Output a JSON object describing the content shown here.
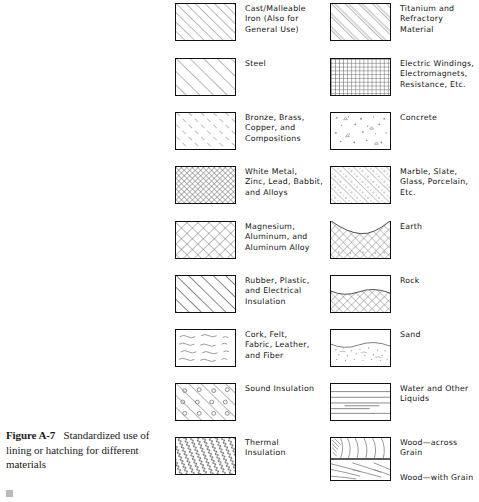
{
  "figure": {
    "caption_number": "Figure A-7",
    "caption_text": "Standardized use of lining or hatching for different materials"
  },
  "left_column": [
    {
      "pattern": "diagonal-hatch-medium",
      "label": "Cast/Malleable\nIron (Also for\nGeneral Use)"
    },
    {
      "pattern": "diagonal-hatch-wide",
      "label": "Steel"
    },
    {
      "pattern": "diagonal-hatch-dashed",
      "label": "Bronze, Brass,\nCopper, and\nCompositions"
    },
    {
      "pattern": "cross-hatch-fine",
      "label": "White Metal,\nZinc, Lead, Babbit,\nand Alloys"
    },
    {
      "pattern": "cross-hatch-coarse",
      "label": "Magnesium,\nAluminum, and\nAluminum Alloy"
    },
    {
      "pattern": "diagonal-hatch-thick",
      "label": "Rubber, Plastic,\nand Electrical\nInsulation"
    },
    {
      "pattern": "squiggle-dashes",
      "label": "Cork, Felt,\nFabric, Leather,\nand Fiber"
    },
    {
      "pattern": "diagonal-with-circles",
      "label": "Sound Insulation"
    },
    {
      "pattern": "zigzag-diagonal",
      "label": "Thermal\nInsulation"
    }
  ],
  "right_column": [
    {
      "pattern": "diagonal-hatch-double",
      "label": "Titanium and\nRefractory\nMaterial"
    },
    {
      "pattern": "square-grid",
      "label": "Electric Windings,\nElectromagnets,\nResistance, Etc."
    },
    {
      "pattern": "speckle-aggregate",
      "label": "Concrete"
    },
    {
      "pattern": "diagonal-hatch-dotted",
      "label": "Marble, Slate,\nGlass, Porcelain,\nEtc."
    },
    {
      "pattern": "earth-fill",
      "label": "Earth"
    },
    {
      "pattern": "rock-fill",
      "label": "Rock"
    },
    {
      "pattern": "sand-stipple",
      "label": "Sand"
    },
    {
      "pattern": "horizontal-lines",
      "label": "Water and Other\nLiquids"
    },
    {
      "pattern": "wood-grain",
      "label_top": "Wood—across Grain",
      "label_bottom": "Wood—with Grain"
    }
  ]
}
